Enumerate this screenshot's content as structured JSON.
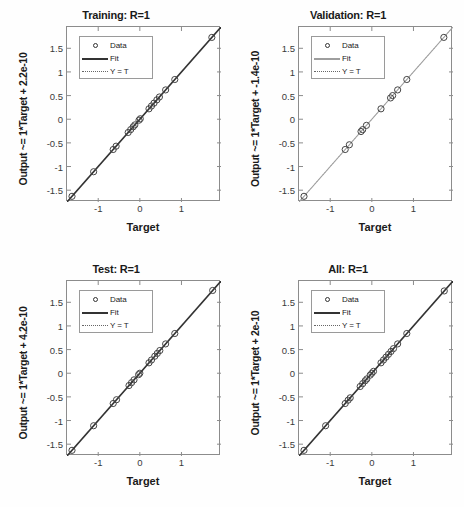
{
  "figure": {
    "background": "#fefefe",
    "axis_color": "#8c8c8c"
  },
  "legend": {
    "data_label": "Data",
    "fit_label": "Fit",
    "yt_label": "Y = T"
  },
  "axes": {
    "xlabel": "Target",
    "xticks": [
      "-1",
      "0",
      "1"
    ],
    "xtick_values": [
      -1,
      0,
      1
    ],
    "yticks": [
      "1.5",
      "1",
      "0.5",
      "0",
      "-0.5",
      "-1",
      "-1.5"
    ],
    "ytick_values": [
      1.5,
      1,
      0.5,
      0,
      -0.5,
      -1,
      -1.5
    ],
    "xlim": [
      -1.75,
      1.95
    ],
    "ylim": [
      -1.75,
      1.95
    ]
  },
  "chart_data": [
    {
      "type": "scatter",
      "panel": "training",
      "title": "Training: R=1",
      "ylabel": "Output ~= 1*Target + 2.2e-10",
      "xlabel": "Target",
      "r_value": 1,
      "slope": 1,
      "intercept": 2.2e-10,
      "fit_color": "#333333",
      "fit_width": 1.6,
      "identity_color": "#777777",
      "marker": "circle",
      "xlim": [
        -1.75,
        1.95
      ],
      "ylim": [
        -1.75,
        1.95
      ],
      "grid": false,
      "legend_position": "top-left",
      "x": [
        -1.63,
        -1.11,
        -0.64,
        -0.57,
        -0.28,
        -0.22,
        -0.16,
        -0.12,
        -0.02,
        0.01,
        0.22,
        0.28,
        0.34,
        0.41,
        0.47,
        0.62,
        0.84,
        1.73
      ],
      "y": [
        -1.63,
        -1.11,
        -0.64,
        -0.57,
        -0.28,
        -0.22,
        -0.16,
        -0.12,
        -0.02,
        0.01,
        0.22,
        0.28,
        0.34,
        0.41,
        0.47,
        0.62,
        0.84,
        1.73
      ]
    },
    {
      "type": "scatter",
      "panel": "validation",
      "title": "Validation: R=1",
      "ylabel": "Output ~= 1*Target + -1.4e-10",
      "xlabel": "Target",
      "r_value": 1,
      "slope": 1,
      "intercept": -1.4e-10,
      "fit_color": "#a0a0a0",
      "fit_width": 1.1,
      "identity_color": "#888888",
      "marker": "circle",
      "xlim": [
        -1.75,
        1.95
      ],
      "ylim": [
        -1.75,
        1.95
      ],
      "grid": false,
      "legend_position": "top-left",
      "x": [
        -1.63,
        -0.64,
        -0.54,
        -0.26,
        -0.22,
        -0.13,
        0.22,
        0.45,
        0.5,
        0.62,
        0.84,
        1.73
      ],
      "y": [
        -1.63,
        -0.64,
        -0.54,
        -0.26,
        -0.22,
        -0.13,
        0.22,
        0.45,
        0.5,
        0.62,
        0.84,
        1.73
      ]
    },
    {
      "type": "scatter",
      "panel": "test",
      "title": "Test: R=1",
      "ylabel": "Output ~= 1*Target + 4.2e-10",
      "xlabel": "Target",
      "r_value": 1,
      "slope": 1,
      "intercept": 4.2e-10,
      "fit_color": "#333333",
      "fit_width": 1.6,
      "identity_color": "#777777",
      "marker": "circle",
      "xlim": [
        -1.75,
        1.95
      ],
      "ylim": [
        -1.75,
        1.95
      ],
      "grid": false,
      "legend_position": "top-left",
      "x": [
        -1.63,
        -1.11,
        -0.64,
        -0.56,
        -0.26,
        -0.2,
        -0.14,
        -0.03,
        0.0,
        0.22,
        0.28,
        0.36,
        0.42,
        0.48,
        0.62,
        0.84,
        1.75
      ],
      "y": [
        -1.63,
        -1.11,
        -0.64,
        -0.56,
        -0.26,
        -0.2,
        -0.14,
        -0.03,
        0.0,
        0.22,
        0.28,
        0.36,
        0.42,
        0.48,
        0.62,
        0.84,
        1.75
      ]
    },
    {
      "type": "scatter",
      "panel": "all",
      "title": "All: R=1",
      "ylabel": "Output ~= 1*Target + 2e-10",
      "xlabel": "Target",
      "r_value": 1,
      "slope": 1,
      "intercept": 2e-10,
      "fit_color": "#333333",
      "fit_width": 1.6,
      "identity_color": "#777777",
      "marker": "circle",
      "xlim": [
        -1.75,
        1.95
      ],
      "ylim": [
        -1.75,
        1.95
      ],
      "grid": false,
      "legend_position": "top-left",
      "x": [
        -1.63,
        -1.11,
        -0.64,
        -0.57,
        -0.52,
        -0.28,
        -0.22,
        -0.16,
        -0.12,
        -0.04,
        0.0,
        0.04,
        0.22,
        0.28,
        0.34,
        0.4,
        0.46,
        0.52,
        0.62,
        0.84,
        1.74
      ],
      "y": [
        -1.63,
        -1.11,
        -0.64,
        -0.57,
        -0.52,
        -0.28,
        -0.22,
        -0.16,
        -0.12,
        -0.04,
        0.0,
        0.04,
        0.22,
        0.28,
        0.34,
        0.4,
        0.46,
        0.52,
        0.62,
        0.84,
        1.74
      ]
    }
  ]
}
